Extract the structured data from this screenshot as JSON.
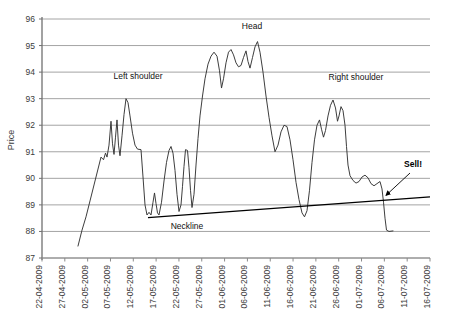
{
  "chart_data": {
    "type": "line",
    "title": "",
    "xlabel": "",
    "ylabel": "Price",
    "ylim": [
      87,
      96
    ],
    "ytick_labels": [
      "96",
      "95",
      "94",
      "93",
      "92",
      "91",
      "90",
      "89",
      "88",
      "87"
    ],
    "yticks": [
      96,
      95,
      94,
      93,
      92,
      91,
      90,
      89,
      88,
      87
    ],
    "grid": true,
    "legend": "none",
    "xtick_labels": [
      "22-04-2009",
      "27-04-2009",
      "02-05-2009",
      "07-05-2009",
      "12-05-2009",
      "17-05-2009",
      "22-05-2009",
      "27-05-2009",
      "01-06-2009",
      "06-06-2009",
      "11-06-2009",
      "16-06-2009",
      "21-06-2009",
      "26-06-2009",
      "01-07-2009",
      "06-07-2009",
      "11-07-2009",
      "16-07-2009"
    ],
    "series": [
      {
        "name": "Price",
        "color": "#333333",
        "points": [
          [
            78.0,
            87.45
          ],
          [
            82.0,
            88.05
          ],
          [
            86.0,
            88.55
          ],
          [
            90.0,
            89.15
          ],
          [
            94.0,
            89.75
          ],
          [
            98.0,
            90.35
          ],
          [
            101.0,
            90.8
          ],
          [
            103.5,
            90.7
          ],
          [
            105.5,
            90.95
          ],
          [
            107.0,
            90.8
          ],
          [
            109.0,
            91.25
          ],
          [
            111.0,
            92.15
          ],
          [
            112.5,
            91.3
          ],
          [
            114.0,
            90.9
          ],
          [
            115.5,
            91.55
          ],
          [
            117.0,
            92.2
          ],
          [
            118.5,
            91.25
          ],
          [
            120.0,
            90.85
          ],
          [
            122.0,
            91.6
          ],
          [
            124.0,
            92.4
          ],
          [
            126.0,
            93.0
          ],
          [
            128.0,
            92.85
          ],
          [
            130.0,
            92.35
          ],
          [
            132.5,
            91.7
          ],
          [
            135.0,
            91.25
          ],
          [
            137.5,
            91.1
          ],
          [
            141.0,
            91.08
          ],
          [
            143.0,
            90.05
          ],
          [
            145.0,
            89.0
          ],
          [
            147.0,
            88.62
          ],
          [
            149.0,
            88.72
          ],
          [
            151.0,
            88.62
          ],
          [
            153.0,
            89.1
          ],
          [
            154.5,
            89.45
          ],
          [
            156.0,
            89.05
          ],
          [
            157.5,
            88.7
          ],
          [
            159.0,
            88.62
          ],
          [
            161.5,
            89.1
          ],
          [
            164.0,
            89.9
          ],
          [
            166.5,
            90.6
          ],
          [
            169.0,
            91.05
          ],
          [
            171.0,
            91.2
          ],
          [
            173.0,
            90.95
          ],
          [
            175.0,
            90.3
          ],
          [
            177.0,
            89.4
          ],
          [
            179.0,
            88.75
          ],
          [
            181.0,
            89.0
          ],
          [
            182.5,
            89.7
          ],
          [
            184.0,
            90.45
          ],
          [
            185.5,
            91.08
          ],
          [
            187.5,
            91.05
          ],
          [
            189.0,
            90.4
          ],
          [
            190.5,
            89.55
          ],
          [
            192.0,
            88.9
          ],
          [
            194.0,
            89.4
          ],
          [
            196.0,
            90.5
          ],
          [
            198.0,
            91.5
          ],
          [
            200.0,
            92.35
          ],
          [
            202.5,
            93.1
          ],
          [
            205.0,
            93.75
          ],
          [
            208.0,
            94.3
          ],
          [
            211.0,
            94.6
          ],
          [
            214.0,
            94.75
          ],
          [
            217.0,
            94.6
          ],
          [
            219.5,
            94.05
          ],
          [
            221.5,
            93.4
          ],
          [
            223.5,
            93.75
          ],
          [
            226.0,
            94.35
          ],
          [
            228.5,
            94.75
          ],
          [
            231.0,
            94.85
          ],
          [
            233.5,
            94.65
          ],
          [
            236.0,
            94.35
          ],
          [
            238.5,
            94.2
          ],
          [
            241.0,
            94.25
          ],
          [
            243.5,
            94.55
          ],
          [
            246.0,
            94.8
          ],
          [
            248.0,
            94.4
          ],
          [
            250.0,
            94.15
          ],
          [
            252.5,
            94.55
          ],
          [
            255.0,
            94.95
          ],
          [
            257.5,
            95.15
          ],
          [
            260.0,
            94.75
          ],
          [
            263.0,
            94.0
          ],
          [
            266.0,
            93.1
          ],
          [
            269.0,
            92.3
          ],
          [
            272.0,
            91.6
          ],
          [
            275.0,
            91.0
          ],
          [
            278.0,
            91.25
          ],
          [
            281.0,
            91.75
          ],
          [
            284.0,
            92.0
          ],
          [
            287.0,
            91.95
          ],
          [
            290.0,
            91.45
          ],
          [
            293.0,
            90.7
          ],
          [
            296.0,
            89.85
          ],
          [
            299.0,
            89.2
          ],
          [
            302.0,
            88.7
          ],
          [
            304.5,
            88.55
          ],
          [
            307.0,
            88.78
          ],
          [
            309.5,
            89.55
          ],
          [
            312.0,
            90.6
          ],
          [
            314.5,
            91.45
          ],
          [
            317.0,
            92.0
          ],
          [
            319.5,
            92.2
          ],
          [
            321.5,
            91.85
          ],
          [
            323.5,
            91.55
          ],
          [
            325.5,
            91.8
          ],
          [
            328.0,
            92.35
          ],
          [
            330.5,
            92.75
          ],
          [
            333.0,
            92.95
          ],
          [
            335.5,
            92.65
          ],
          [
            337.5,
            92.15
          ],
          [
            339.0,
            92.35
          ],
          [
            341.0,
            92.7
          ],
          [
            343.0,
            92.55
          ],
          [
            345.0,
            92.0
          ],
          [
            346.5,
            91.2
          ],
          [
            348.0,
            90.5
          ],
          [
            350.0,
            90.1
          ],
          [
            353.0,
            89.92
          ],
          [
            356.0,
            89.82
          ],
          [
            359.0,
            89.88
          ],
          [
            362.0,
            90.05
          ],
          [
            365.0,
            90.12
          ],
          [
            368.0,
            90.02
          ],
          [
            371.0,
            89.8
          ],
          [
            374.0,
            89.72
          ],
          [
            377.0,
            89.8
          ],
          [
            380.0,
            89.88
          ],
          [
            382.0,
            89.6
          ],
          [
            383.5,
            89.1
          ],
          [
            385.0,
            88.5
          ],
          [
            386.5,
            88.05
          ],
          [
            389.0,
            88.0
          ],
          [
            393.0,
            88.02
          ]
        ]
      }
    ],
    "trendlines": [
      {
        "name": "Neckline",
        "color": "#000000",
        "from": [
          148.0,
          88.52
        ],
        "to": [
          430.0,
          89.3
        ]
      }
    ],
    "annotations": [
      {
        "id": "left-shoulder",
        "text": "Left shoulder",
        "x": 138.0,
        "y": 93.75,
        "bold": false
      },
      {
        "id": "head",
        "text": "Head",
        "x": 252.0,
        "y": 95.62,
        "bold": false
      },
      {
        "id": "right-shoulder",
        "text": "Right shoulder",
        "x": 356.0,
        "y": 93.72,
        "bold": false
      },
      {
        "id": "neckline",
        "text": "Neckline",
        "x": 187.0,
        "y": 88.1,
        "bold": false
      },
      {
        "id": "sell",
        "text": "Sell!",
        "x": 413.0,
        "y": 90.42,
        "bold": true
      }
    ],
    "arrows": [
      {
        "id": "sell-arrow",
        "from": [
          410.0,
          90.2
        ],
        "to": [
          386.0,
          89.36
        ]
      }
    ]
  },
  "colors": {
    "grid": "#9a9a9a",
    "axis": "#808080",
    "series": "#333333",
    "trendline": "#000000",
    "tick_text": "#3b3b3b",
    "annotation_text": "#111111",
    "background": "#ffffff"
  }
}
